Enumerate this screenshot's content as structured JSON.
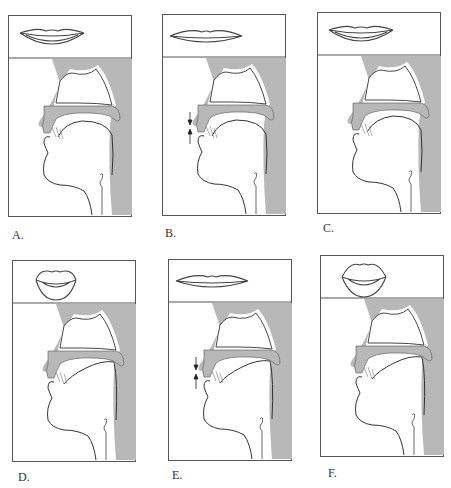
{
  "figure": {
    "colors": {
      "background": "#ffffff",
      "outline": "#555555",
      "shade": "#b8b8b8",
      "line": "#333333"
    },
    "panels": [
      {
        "label": "A.",
        "lips": "spread",
        "tongue": "low",
        "arrows": false
      },
      {
        "label": "B.",
        "lips": "closed-flat",
        "tongue": "low",
        "arrows": true
      },
      {
        "label": "C.",
        "lips": "spread",
        "tongue": "low-front",
        "arrows": false
      },
      {
        "label": "D.",
        "lips": "rounded",
        "tongue": "high-back",
        "arrows": false
      },
      {
        "label": "E.",
        "lips": "closed-flat",
        "tongue": "high-back",
        "arrows": true
      },
      {
        "label": "F.",
        "lips": "rounded-protruded",
        "tongue": "high-back",
        "arrows": false
      }
    ]
  }
}
